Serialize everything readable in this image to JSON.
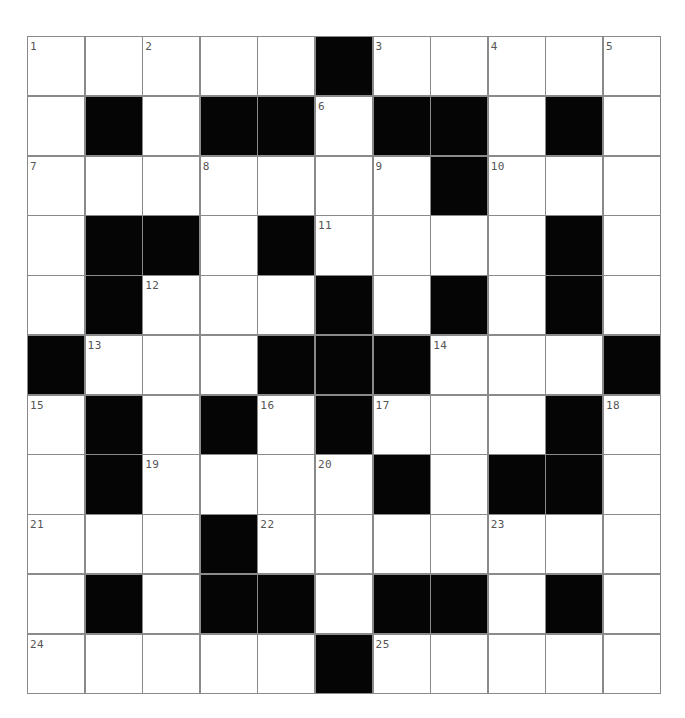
{
  "puzzle": {
    "rows": 11,
    "cols": 11,
    "colors": {
      "block": "#050505",
      "cell": "#ffffff",
      "grid_line": "#8a8a8a",
      "number": "#555555"
    },
    "grid": [
      [
        "1",
        ".",
        "2",
        ".",
        ".",
        "#",
        "3",
        ".",
        "4",
        ".",
        "5"
      ],
      [
        ".",
        "#",
        ".",
        "#",
        "#",
        "6",
        "#",
        "#",
        ".",
        "#",
        "."
      ],
      [
        "7",
        ".",
        ".",
        "8",
        ".",
        ".",
        "9",
        "#",
        "10",
        ".",
        "."
      ],
      [
        ".",
        "#",
        "#",
        ".",
        "#",
        "11",
        ".",
        ".",
        ".",
        "#",
        "."
      ],
      [
        ".",
        "#",
        "12",
        ".",
        ".",
        "#",
        ".",
        "#",
        ".",
        "#",
        "."
      ],
      [
        "#",
        "13",
        ".",
        ".",
        "#",
        "#",
        "#",
        "14",
        ".",
        ".",
        "#"
      ],
      [
        "15",
        "#",
        ".",
        "#",
        "16",
        "#",
        "17",
        ".",
        ".",
        "#",
        "18"
      ],
      [
        ".",
        "#",
        "19",
        ".",
        ".",
        "20",
        "#",
        ".",
        "#",
        "#",
        "."
      ],
      [
        "21",
        ".",
        ".",
        "#",
        "22",
        ".",
        ".",
        ".",
        "23",
        ".",
        "."
      ],
      [
        ".",
        "#",
        ".",
        "#",
        "#",
        ".",
        "#",
        "#",
        ".",
        "#",
        "."
      ],
      [
        "24",
        ".",
        ".",
        ".",
        ".",
        "#",
        "25",
        ".",
        ".",
        ".",
        "."
      ]
    ],
    "legend": {
      "#": "black block",
      ".": "empty white cell",
      "number": "clue number in white cell"
    }
  }
}
